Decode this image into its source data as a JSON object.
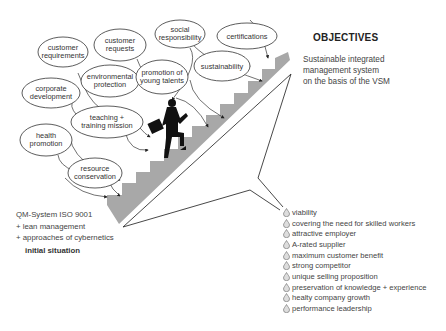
{
  "diagram": {
    "bubbles": [
      {
        "id": "customer-requirements",
        "lines": [
          "customer",
          "requirements"
        ]
      },
      {
        "id": "customer-requests",
        "lines": [
          "customer",
          "requests"
        ]
      },
      {
        "id": "social-responsibility",
        "lines": [
          "social",
          "responsibility"
        ]
      },
      {
        "id": "certifications",
        "lines": [
          "certifications"
        ]
      },
      {
        "id": "corporate-development",
        "lines": [
          "corporate",
          "development"
        ]
      },
      {
        "id": "environmental-protection",
        "lines": [
          "environmental",
          "protection"
        ]
      },
      {
        "id": "promotion-young-talents",
        "lines": [
          "promotion of",
          "young talents"
        ]
      },
      {
        "id": "sustainability",
        "lines": [
          "sustainability"
        ]
      },
      {
        "id": "teaching-training-mission",
        "lines": [
          "teaching +",
          "training mission"
        ]
      },
      {
        "id": "health-promotion",
        "lines": [
          "health",
          "promotion"
        ]
      },
      {
        "id": "resource-conservation",
        "lines": [
          "resource",
          "conservation"
        ]
      }
    ],
    "objectives": {
      "title": "OBJECTIVES",
      "description": "Sustainable integrated\nmanagement system\non the basis of the VSM"
    },
    "initial": {
      "lines": [
        "QM-System ISO 9001",
        "+ lean management",
        "+ approaches of cybernetics"
      ],
      "label": "initial situation"
    },
    "goals": [
      "viability",
      "covering the need for skilled workers",
      "attractive employer",
      "A-rated supplier",
      "maximum customer benefit",
      "strong competitor",
      "unique selling proposition",
      "preservation of knowledge + experience",
      "healty company growth",
      "performance leadership"
    ],
    "colors": {
      "stairs": "#a8a8a8",
      "outline": "#333333",
      "figure": "#111111"
    }
  }
}
